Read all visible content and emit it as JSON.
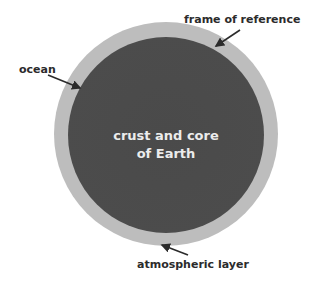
{
  "diagram": {
    "center_label_line1": "crust and core",
    "center_label_line2": "of Earth",
    "labels": {
      "frame": "frame of reference",
      "ocean": "ocean",
      "atmosphere": "atmospheric layer"
    },
    "colors": {
      "outer_ring": "#bdbdbd",
      "core": "#4b4b4b",
      "center_text": "#ececec",
      "label_text": "#2b2b2b"
    }
  }
}
